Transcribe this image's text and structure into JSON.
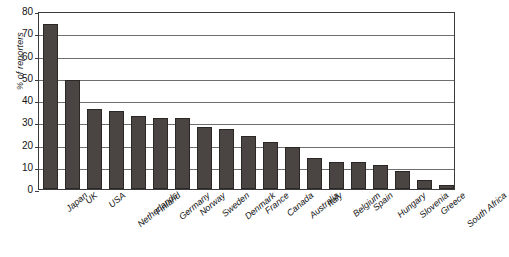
{
  "chart_data": {
    "type": "bar",
    "title": "",
    "xlabel": "",
    "ylabel": "% of reporters",
    "ylim": [
      0,
      80
    ],
    "yticks": [
      0,
      10,
      20,
      30,
      40,
      50,
      60,
      70,
      80
    ],
    "grid": true,
    "legend": false,
    "orientation": "vertical",
    "bar_color": "#4a4542",
    "bar_edge_color": "#2b2724",
    "axis_color": "#3b3b3b",
    "gridline_color": "#6f6f6f",
    "background_color": "#ffffff",
    "x_tick_label_rotation": -40,
    "categories": [
      "Japan",
      "UK",
      "USA",
      "Netherlands",
      "Finland",
      "Germany",
      "Norway",
      "Sweden",
      "Denmark",
      "France",
      "Canada",
      "Australia",
      "Italy",
      "Belgium",
      "Spain",
      "Hungary",
      "Slovenia",
      "Greece",
      "South Africa"
    ],
    "values": [
      74,
      49,
      36,
      35,
      33,
      32,
      32,
      28,
      27,
      24,
      21,
      19,
      14,
      12,
      12,
      11,
      8,
      4,
      2
    ]
  }
}
